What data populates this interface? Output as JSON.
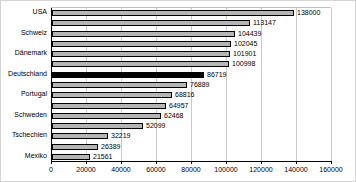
{
  "chart_data": {
    "type": "bar",
    "orientation": "horizontal",
    "title": "",
    "xlabel": "",
    "ylabel": "",
    "categories": [
      "USA",
      "",
      "Schweiz",
      "",
      "Dänemark",
      "",
      "Deutschland",
      "",
      "Portugal",
      "",
      "Schweden",
      "",
      "Tschechien",
      "",
      "Mexiko"
    ],
    "values": [
      138000,
      113147,
      104439,
      102045,
      101901,
      100998,
      86719,
      76889,
      68816,
      64957,
      62468,
      52099,
      32219,
      26389,
      21561
    ],
    "value_labels_shown": true,
    "highlight_index": 6,
    "highlighted_category": "Deutschland",
    "xlim": [
      0,
      160000
    ],
    "x_ticks": [
      0,
      20000,
      40000,
      60000,
      80000,
      100000,
      120000,
      140000,
      160000
    ],
    "grid": true,
    "legend": "none",
    "colors": {
      "bar_fill": "#b5b5b5",
      "bar_border": "#000000",
      "highlight_fill": "#000000",
      "gridline": "#c9c9c9",
      "axis": "#000000",
      "background": "#ffffff"
    }
  }
}
